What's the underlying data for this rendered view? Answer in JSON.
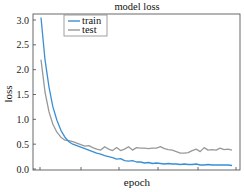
{
  "chart_data": {
    "type": "line",
    "title": "model loss",
    "xlabel": "epoch",
    "ylabel": "loss",
    "xlim": [
      0,
      50
    ],
    "ylim": [
      -0.05,
      3.1
    ],
    "yticks": [
      0.0,
      0.5,
      1.0,
      1.5,
      2.0,
      2.5,
      3.0
    ],
    "ytick_labels": [
      "0.0",
      "0.5",
      "1.0",
      "1.5",
      "2.0",
      "2.5",
      "3.0"
    ],
    "xticks": [
      0,
      10,
      20,
      30,
      40,
      50
    ],
    "xtick_labels": [
      "",
      "",
      "",
      "",
      "",
      ""
    ],
    "grid": false,
    "legend_position": "upper left",
    "series": [
      {
        "name": "train",
        "color": "#3a8fd4",
        "x": [
          0,
          1,
          2,
          3,
          4,
          5,
          6,
          7,
          8,
          9,
          10,
          11,
          12,
          13,
          14,
          15,
          16,
          17,
          18,
          19,
          20,
          21,
          22,
          23,
          24,
          25,
          26,
          27,
          28,
          29,
          30,
          31,
          32,
          33,
          34,
          35,
          36,
          37,
          38,
          39,
          40,
          41,
          42,
          43,
          44,
          45,
          46,
          47,
          48
        ],
        "values": [
          3.05,
          2.2,
          1.65,
          1.25,
          0.98,
          0.78,
          0.64,
          0.55,
          0.5,
          0.47,
          0.44,
          0.41,
          0.38,
          0.35,
          0.32,
          0.3,
          0.27,
          0.25,
          0.23,
          0.2,
          0.21,
          0.17,
          0.16,
          0.17,
          0.14,
          0.14,
          0.12,
          0.13,
          0.11,
          0.12,
          0.11,
          0.1,
          0.11,
          0.1,
          0.1,
          0.09,
          0.1,
          0.09,
          0.09,
          0.1,
          0.08,
          0.08,
          0.09,
          0.08,
          0.08,
          0.08,
          0.08,
          0.08,
          0.07
        ]
      },
      {
        "name": "test",
        "color": "#999999",
        "x": [
          0,
          1,
          2,
          3,
          4,
          5,
          6,
          7,
          8,
          9,
          10,
          11,
          12,
          13,
          14,
          15,
          16,
          17,
          18,
          19,
          20,
          21,
          22,
          23,
          24,
          25,
          26,
          27,
          28,
          29,
          30,
          31,
          32,
          33,
          34,
          35,
          36,
          37,
          38,
          39,
          40,
          41,
          42,
          43,
          44,
          45,
          46,
          47,
          48
        ],
        "values": [
          2.2,
          1.55,
          1.15,
          0.9,
          0.74,
          0.64,
          0.58,
          0.57,
          0.55,
          0.52,
          0.49,
          0.46,
          0.47,
          0.43,
          0.4,
          0.38,
          0.45,
          0.4,
          0.37,
          0.43,
          0.37,
          0.4,
          0.45,
          0.38,
          0.43,
          0.42,
          0.42,
          0.41,
          0.42,
          0.42,
          0.45,
          0.41,
          0.39,
          0.38,
          0.35,
          0.32,
          0.32,
          0.33,
          0.37,
          0.4,
          0.35,
          0.43,
          0.38,
          0.39,
          0.38,
          0.42,
          0.39,
          0.4,
          0.38
        ]
      }
    ]
  }
}
